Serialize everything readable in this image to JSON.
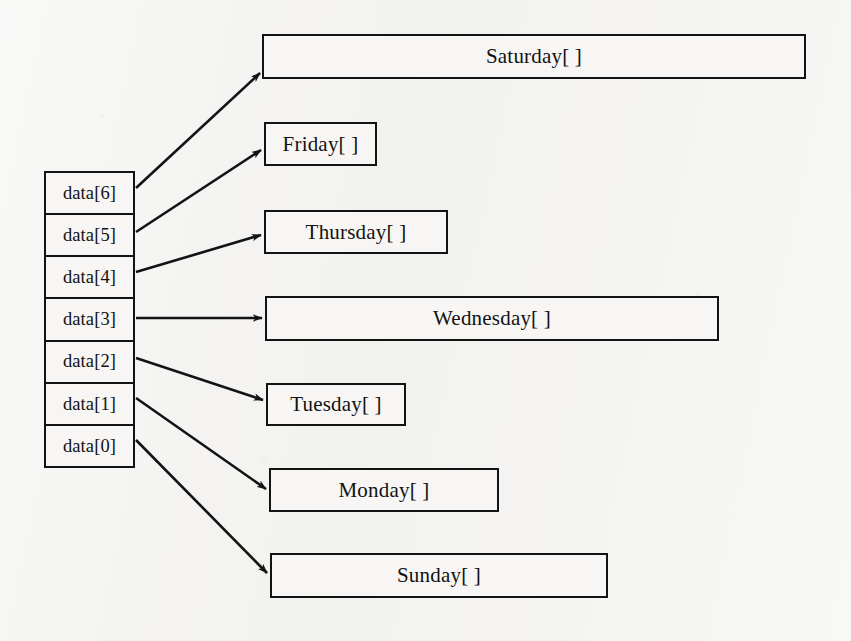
{
  "diagram": {
    "type": "array-of-pointers",
    "title": "",
    "background_color": "#f4f3f1",
    "line_color": "#131313",
    "array": {
      "name": "data",
      "label": "array-cells",
      "cells": [
        {
          "label": "data[6]",
          "index": 6,
          "points_to": "Saturday[ ]"
        },
        {
          "label": "data[5]",
          "index": 5,
          "points_to": "Friday[ ]"
        },
        {
          "label": "data[4]",
          "index": 4,
          "points_to": "Thursday[ ]"
        },
        {
          "label": "data[3]",
          "index": 3,
          "points_to": "Wednesday[ ]"
        },
        {
          "label": "data[2]",
          "index": 2,
          "points_to": "Tuesday[ ]"
        },
        {
          "label": "data[1]",
          "index": 1,
          "points_to": "Monday[ ]"
        },
        {
          "label": "data[0]",
          "index": 0,
          "points_to": "Sunday[ ]"
        }
      ]
    },
    "targets": [
      {
        "label": "Saturday[ ]",
        "x": 262,
        "y": 34,
        "w": 544,
        "h": 45
      },
      {
        "label": "Friday[ ]",
        "x": 264,
        "y": 122,
        "w": 113,
        "h": 44
      },
      {
        "label": "Thursday[ ]",
        "x": 264,
        "y": 210,
        "w": 184,
        "h": 44
      },
      {
        "label": "Wednesday[ ]",
        "x": 265,
        "y": 296,
        "w": 454,
        "h": 45
      },
      {
        "label": "Tuesday[ ]",
        "x": 266,
        "y": 383,
        "w": 140,
        "h": 43
      },
      {
        "label": "Monday[ ]",
        "x": 269,
        "y": 468,
        "w": 230,
        "h": 44
      },
      {
        "label": "Sunday[ ]",
        "x": 270,
        "y": 553,
        "w": 338,
        "h": 45
      }
    ],
    "arrows": [
      {
        "from": "data[6]",
        "to": "Saturday[ ]",
        "x1": 136,
        "y1": 188,
        "x2": 260,
        "y2": 73
      },
      {
        "from": "data[5]",
        "to": "Friday[ ]",
        "x1": 136,
        "y1": 232,
        "x2": 261,
        "y2": 150
      },
      {
        "from": "data[4]",
        "to": "Thursday[ ]",
        "x1": 136,
        "y1": 272,
        "x2": 261,
        "y2": 235
      },
      {
        "from": "data[3]",
        "to": "Wednesday[ ]",
        "x1": 136,
        "y1": 318,
        "x2": 262,
        "y2": 318
      },
      {
        "from": "data[2]",
        "to": "Tuesday[ ]",
        "x1": 136,
        "y1": 358,
        "x2": 263,
        "y2": 400
      },
      {
        "from": "data[1]",
        "to": "Monday[ ]",
        "x1": 136,
        "y1": 398,
        "x2": 266,
        "y2": 489
      },
      {
        "from": "data[0]",
        "to": "Sunday[ ]",
        "x1": 136,
        "y1": 440,
        "x2": 267,
        "y2": 573
      }
    ]
  }
}
